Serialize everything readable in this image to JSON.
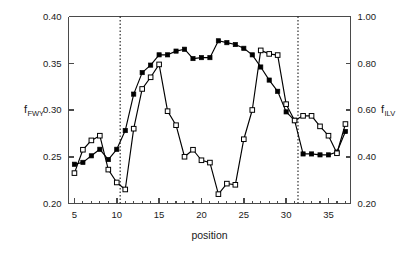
{
  "chart_data": {
    "type": "line",
    "title": "",
    "subtitle": "",
    "xlabel": "position",
    "ylabel": "f_FWY",
    "y2label": "f_ILV",
    "xlim": [
      4.3,
      37.6
    ],
    "ylim": [
      0.2,
      0.4
    ],
    "y2lim": [
      0.2,
      1.0
    ],
    "grid": false,
    "legend_position": "none",
    "x_ticks_major": [
      5,
      10,
      15,
      20,
      25,
      30,
      35
    ],
    "x_ticks_major_labels": [
      "5",
      "10",
      "15",
      "20",
      "25",
      "30",
      "35"
    ],
    "x_tick_minor_step": 1,
    "y_ticks": [
      0.2,
      0.25,
      0.3,
      0.35,
      0.4
    ],
    "y_tick_labels": [
      "0.20",
      "0.25",
      "0.30",
      "0.35",
      "0.40"
    ],
    "y2_ticks": [
      0.2,
      0.4,
      0.6,
      0.8,
      1.0
    ],
    "y2_tick_labels": [
      "0.20",
      "0.40",
      "0.60",
      "0.80",
      "1.00"
    ],
    "annotations": [
      {
        "type": "vline",
        "x": 10.4,
        "style": "dotted"
      },
      {
        "type": "vline",
        "x": 31.4,
        "style": "dotted"
      }
    ],
    "x": [
      5,
      6,
      7,
      8,
      9,
      10,
      11,
      12,
      13,
      14,
      15,
      16,
      17,
      18,
      19,
      20,
      21,
      22,
      23,
      24,
      25,
      26,
      27,
      28,
      29,
      30,
      31,
      32,
      33,
      34,
      35,
      36,
      37
    ],
    "series": [
      {
        "name": "f_FWY",
        "axis": "left",
        "marker": "filled-square",
        "values": [
          0.242,
          0.244,
          0.251,
          0.258,
          0.247,
          0.258,
          0.278,
          0.317,
          0.34,
          0.348,
          0.359,
          0.359,
          0.363,
          0.365,
          0.355,
          0.356,
          0.356,
          0.374,
          0.372,
          0.37,
          0.366,
          0.359,
          0.346,
          0.332,
          0.32,
          0.298,
          0.289,
          0.253,
          0.253,
          0.252,
          0.252,
          0.255,
          0.277
        ]
      },
      {
        "name": "f_ILV",
        "axis": "right",
        "marker": "open-square",
        "values": [
          0.33,
          0.43,
          0.47,
          0.49,
          0.345,
          0.29,
          0.26,
          0.52,
          0.69,
          0.74,
          0.795,
          0.595,
          0.535,
          0.4,
          0.43,
          0.385,
          0.375,
          0.24,
          0.285,
          0.28,
          0.475,
          0.6,
          0.855,
          0.84,
          0.835,
          0.625,
          0.555,
          0.575,
          0.575,
          0.53,
          0.49,
          0.415,
          0.54
        ]
      }
    ]
  },
  "axis_labels": {
    "left_base": "f",
    "left_sub": "FWY",
    "right_base": "f",
    "right_sub": "ILV",
    "x": "position"
  },
  "colors": {
    "axis": "#4a4a4a",
    "series": "#000000",
    "background": "#ffffff",
    "refline": "#1a1a1a"
  }
}
